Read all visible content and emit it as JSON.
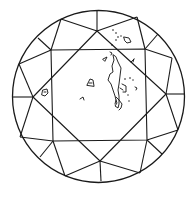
{
  "diagram": {
    "type": "diamond-clarity-plot",
    "view": "crown",
    "shape": "round brilliant",
    "girdle": {
      "cx": 98.5,
      "cy": 96.5,
      "r": 86
    },
    "table": [
      [
        51,
        50
      ],
      [
        145,
        49
      ],
      [
        147,
        140
      ],
      [
        53,
        141
      ]
    ],
    "star_points": [
      [
        97,
        31
      ],
      [
        166,
        94
      ],
      [
        100,
        161
      ],
      [
        33,
        97
      ]
    ],
    "upper_girdle_points": [
      [
        61,
        19
      ],
      [
        137,
        17
      ],
      [
        172,
        58
      ],
      [
        178,
        130
      ],
      [
        140,
        173
      ],
      [
        65,
        176
      ],
      [
        20,
        137
      ],
      [
        19,
        64
      ]
    ],
    "girdle_tick_points": [
      [
        97,
        11
      ],
      [
        184,
        94
      ],
      [
        101,
        181
      ],
      [
        13,
        97
      ],
      [
        38,
        38
      ],
      [
        158,
        34
      ],
      [
        162,
        154
      ],
      [
        40,
        157
      ]
    ],
    "stroke_color": "#1a1a1a",
    "background_color": "#ffffff",
    "inclusions": [
      {
        "kind": "feather",
        "label": "",
        "description": "long vertical cleavage/feather right of table center"
      },
      {
        "kind": "crystal",
        "label": "",
        "description": "small mark 'A'-like near table center"
      },
      {
        "kind": "crystal",
        "label": "",
        "description": "small mark left crown, star facet"
      },
      {
        "kind": "cloud",
        "label": "",
        "description": "scattered pinpoints upper right crown"
      },
      {
        "kind": "crystal",
        "label": "",
        "description": "small loop mark upper right crown"
      },
      {
        "kind": "pinpoint",
        "label": "",
        "description": "small pinpoints right of feather"
      }
    ]
  }
}
